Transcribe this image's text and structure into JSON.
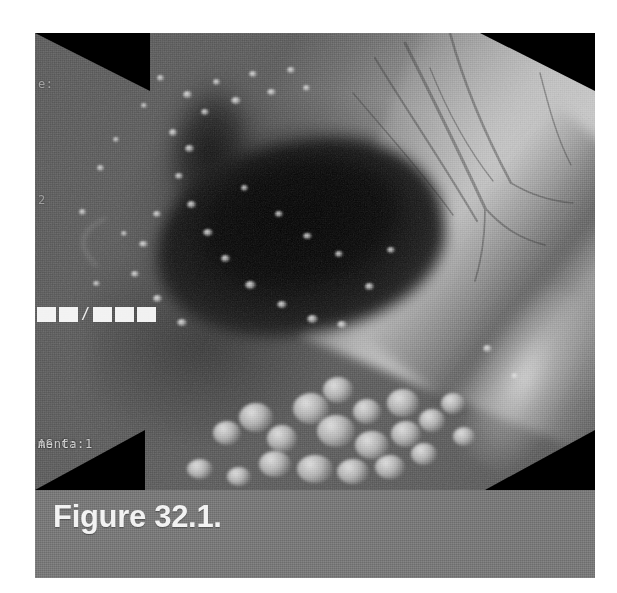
{
  "page": {
    "background_color": "#ffffff",
    "width": 617,
    "height": 593
  },
  "figure": {
    "caption": "Figure 32.1.",
    "caption_bar_color": "#7a7a7a",
    "caption_text_color": "#f2f2f2",
    "photo": {
      "kind": "endoscopy-photograph",
      "modality": "upper gastrointestinal endoscopy",
      "rendering": "grayscale halftone print scan",
      "vignette": "octagonal black corners",
      "description": "Endoscopic view of a gastrointestinal lumen with a dark central opening, bright nodular cobblestone mucosa inferiorly and a prominent bright mucosal fold on the right with visible vascular markings",
      "frame_color": "#000000"
    },
    "overlay": {
      "label": "endoscope on-screen display",
      "lines": [
        {
          "id": "osd-line-1",
          "text": "e:"
        },
        {
          "id": "osd-line-2",
          "text": "2"
        },
        {
          "id": "osd-line-3",
          "text": "/"
        },
        {
          "id": "osd-line-4",
          "text": "AS Ca:1"
        },
        {
          "id": "osd-line-5",
          "text": "ment:"
        }
      ],
      "date_blocks": {
        "label": "masked date field",
        "left_count": 2,
        "separator": "/",
        "right_count": 3
      },
      "text_color": "#ffffff"
    }
  }
}
